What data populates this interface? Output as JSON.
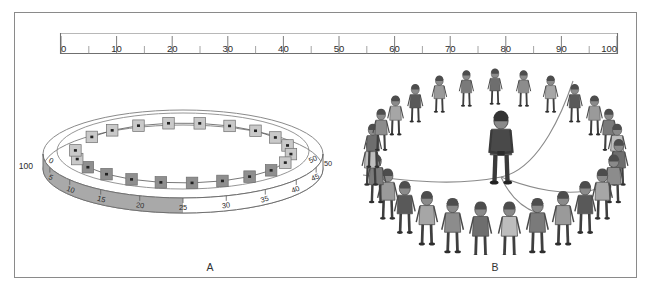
{
  "figure": {
    "frame": {
      "border_color": "#8a8a8a"
    },
    "captions": {
      "panel_a": "A",
      "panel_b": "B"
    }
  },
  "ruler": {
    "name": "horizontal-number-line",
    "min": 0,
    "max": 100,
    "major_step": 10,
    "minor_step": 5,
    "labels": [
      "0",
      "10",
      "20",
      "30",
      "40",
      "50",
      "60",
      "70",
      "80",
      "90",
      "100"
    ],
    "values": [
      0,
      10,
      20,
      30,
      40,
      50,
      60,
      70,
      80,
      90,
      100
    ],
    "color": "#7d7d7d"
  },
  "panel_a": {
    "title": "A",
    "ring": {
      "scale_labels": [
        "0",
        "5",
        "10",
        "15",
        "20",
        "25",
        "30",
        "35",
        "40",
        "45",
        "50"
      ],
      "scale_values": [
        0,
        5,
        10,
        15,
        20,
        25,
        30,
        35,
        40,
        45,
        50
      ],
      "shaded_from": 0,
      "shaded_to": 25,
      "shaded_color": "#a9a9a9",
      "unshaded_color": "#ffffff",
      "band_outline": "#6f6f6f",
      "seam_label": "100",
      "start_label": "0",
      "end_label": "50"
    },
    "markers": {
      "count": 21,
      "light_color": "#c9c9c9",
      "dark_color": "#8f8f8f",
      "border_color": "#6e6e6e",
      "connector_color": "#555555",
      "note": "chain of square markers with arrow-dots linked around the inner ellipse"
    }
  },
  "panel_b": {
    "title": "B",
    "scene": "children standing in a large ring with an adult in the centre holding a rope",
    "people_count": 28,
    "rope_color": "#8a8a8a",
    "ink_color": "#4a4a4a"
  },
  "chart_data": {
    "type": "line",
    "title": "",
    "xlabel": "",
    "ylabel": "",
    "charts": [
      {
        "name": "top-number-line",
        "type": "line",
        "x": [
          0,
          10,
          20,
          30,
          40,
          50,
          60,
          70,
          80,
          90,
          100
        ],
        "tick_labels": [
          "0",
          "10",
          "20",
          "30",
          "40",
          "50",
          "60",
          "70",
          "80",
          "90",
          "100"
        ],
        "xlim": [
          0,
          100
        ],
        "minor_ticks": [
          5,
          15,
          25,
          35,
          45,
          55,
          65,
          75,
          85,
          95
        ],
        "grid": false,
        "legend": "none"
      },
      {
        "name": "ring-scale-panel-A",
        "type": "line",
        "x": [
          0,
          5,
          10,
          15,
          20,
          25,
          30,
          35,
          40,
          45,
          50
        ],
        "tick_labels": [
          "0",
          "5",
          "10",
          "15",
          "20",
          "25",
          "30",
          "35",
          "40",
          "45",
          "50"
        ],
        "xlim": [
          0,
          50
        ],
        "shaded_region": [
          0,
          25
        ],
        "wrap_label": "100",
        "grid": false,
        "legend": "none"
      }
    ]
  }
}
